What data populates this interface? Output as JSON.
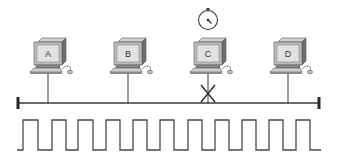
{
  "diagram": {
    "colors": {
      "line": "#3a3a3a",
      "monitor_body": "#bdbdbd",
      "monitor_dark": "#6e6e6e",
      "screen": "#e2e2e2",
      "background": "#ffffff"
    },
    "nodes": [
      {
        "id": "A",
        "label": "A",
        "x": 48,
        "state": "connected"
      },
      {
        "id": "B",
        "label": "B",
        "x": 128,
        "state": "connected"
      },
      {
        "id": "C",
        "label": "C",
        "x": 208,
        "state": "blocked",
        "has_timer": true
      },
      {
        "id": "D",
        "label": "D",
        "x": 288,
        "state": "connected"
      }
    ],
    "icons": {
      "timer": "stopwatch-icon",
      "blocked": "x-mark-icon",
      "computer": "computer-icon"
    },
    "bus": {
      "x1": 18,
      "x2": 320,
      "y": 103
    },
    "signal": {
      "type": "square-wave",
      "pulse_count": 11,
      "low_y": 150,
      "high_y": 120
    }
  }
}
